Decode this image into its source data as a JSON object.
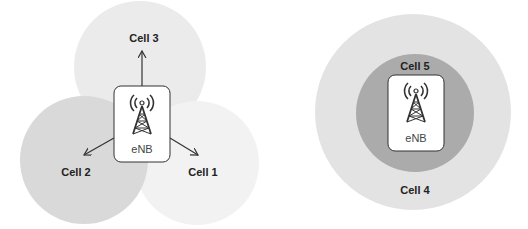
{
  "diagrams": {
    "sectorized": {
      "node_label": "eNB",
      "cells": [
        {
          "label": "Cell 1",
          "fill": "#f2f2f2"
        },
        {
          "label": "Cell 2",
          "fill": "#d9d9d9"
        },
        {
          "label": "Cell 3",
          "fill": "#ebebeb"
        }
      ]
    },
    "layered": {
      "node_label": "eNB",
      "cells": [
        {
          "label": "Cell 4",
          "fill": "#e3e3e3"
        },
        {
          "label": "Cell 5",
          "fill": "#ababab"
        }
      ]
    }
  },
  "colors": {
    "box_fill": "#ffffff",
    "box_stroke": "#333333",
    "arrow": "#333333"
  }
}
